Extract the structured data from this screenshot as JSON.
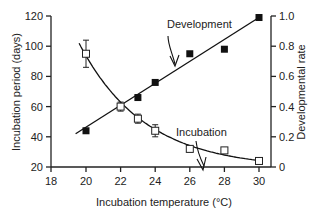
{
  "chart_data": {
    "type": "scatter",
    "title": "",
    "xlabel": "Incubation temperature (°C)",
    "ylabel": "Incubation period (days)",
    "y2label": "Developmental rate",
    "xlim": [
      18,
      31
    ],
    "ylim": [
      20,
      120
    ],
    "y2lim": [
      0,
      1.0
    ],
    "x_ticks": [
      18,
      20,
      22,
      24,
      26,
      28,
      30
    ],
    "y_ticks": [
      20,
      40,
      60,
      80,
      100,
      120
    ],
    "y2_ticks": [
      "0",
      "0.2",
      "0.4",
      "0.6",
      "0.8",
      "1.0"
    ],
    "grid": false,
    "series": [
      {
        "name": "Incubation",
        "marker": "open-square",
        "axis": "left",
        "x": [
          20,
          22,
          23,
          24,
          26,
          28,
          30
        ],
        "values": [
          95,
          60,
          52,
          44,
          32,
          31,
          24
        ],
        "error": [
          9,
          3,
          3,
          4,
          2,
          0,
          0
        ],
        "fit": "exponential-decay"
      },
      {
        "name": "Development",
        "marker": "filled-square",
        "axis": "right",
        "x": [
          20,
          23,
          24,
          26,
          28,
          30
        ],
        "values": [
          0.24,
          0.46,
          0.56,
          0.75,
          0.78,
          0.98
        ],
        "values_left_scale": [
          44,
          66,
          76,
          95,
          98,
          119
        ],
        "fit": "linear"
      }
    ],
    "annotations": [
      {
        "text": "Development",
        "points_to": "development-line"
      },
      {
        "text": "Incubation",
        "points_to": "incubation-curve"
      }
    ]
  },
  "labels": {
    "xlabel": "Incubation temperature (°C)",
    "ylabel": "Incubation period (days)",
    "y2label": "Developmental rate",
    "annot_dev": "Development",
    "annot_inc": "Incubation"
  }
}
